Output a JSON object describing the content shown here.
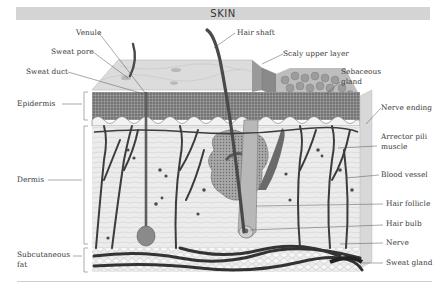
{
  "title": "SKIN",
  "labels": {
    "left": [
      {
        "id": "venule",
        "text": "Venule"
      },
      {
        "id": "sweat-pore",
        "text": "Sweat pore"
      },
      {
        "id": "sweat-duct",
        "text": "Sweat duct"
      },
      {
        "id": "epidermis",
        "text": "Epidermis"
      },
      {
        "id": "dermis",
        "text": "Dermis"
      },
      {
        "id": "subcutaneous-fat-1",
        "text": "Subcutaneous"
      },
      {
        "id": "subcutaneous-fat-2",
        "text": "fat"
      }
    ],
    "right": [
      {
        "id": "hair-shaft",
        "text": "Hair shaft"
      },
      {
        "id": "scaly-upper-layer",
        "text": "Scaly upper layer"
      },
      {
        "id": "sebaceous-1",
        "text": "Sebaceous"
      },
      {
        "id": "sebaceous-2",
        "text": "gland"
      },
      {
        "id": "nerve-ending",
        "text": "Nerve ending"
      },
      {
        "id": "arrector-1",
        "text": "Arrector pili"
      },
      {
        "id": "arrector-2",
        "text": "muscle"
      },
      {
        "id": "blood-vessel",
        "text": "Blood vessel"
      },
      {
        "id": "hair-follicle",
        "text": "Hair follicle"
      },
      {
        "id": "hair-bulb",
        "text": "Hair bulb"
      },
      {
        "id": "nerve",
        "text": "Nerve"
      },
      {
        "id": "sweat-gland",
        "text": "Sweat gland"
      }
    ]
  },
  "colors": {
    "title_bar": "#d4d4d4",
    "ink": "#333333",
    "epidermis_dark": "#6e6e6e",
    "dermis_bg": "#e9e9e9",
    "vessel": "#3c3c3c"
  }
}
